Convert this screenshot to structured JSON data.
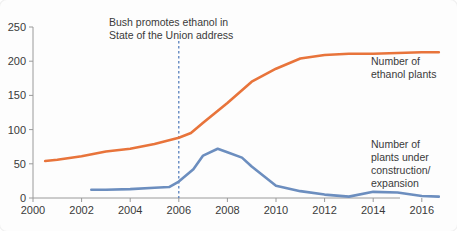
{
  "chart_data": {
    "type": "line",
    "title": "",
    "subtitle": "",
    "xlabel": "",
    "ylabel": "",
    "xlim": [
      2000,
      2017
    ],
    "ylim": [
      0,
      250
    ],
    "grid": false,
    "legend_position": "right-inline",
    "x_ticks": [
      "2000",
      "2002",
      "2004",
      "2006",
      "2008",
      "2010",
      "2012",
      "2014",
      "2016"
    ],
    "x_tick_values": [
      2000,
      2002,
      2004,
      2006,
      2008,
      2010,
      2012,
      2014,
      2016
    ],
    "y_ticks": [
      "0",
      "50",
      "100",
      "150",
      "200",
      "250"
    ],
    "y_tick_values": [
      0,
      50,
      100,
      150,
      200,
      250
    ],
    "series": [
      {
        "name": "Number of ethanol plants",
        "color": "#E8743B",
        "x": [
          2000.5,
          2001,
          2002,
          2003,
          2004,
          2005,
          2006,
          2006.5,
          2007,
          2008,
          2009,
          2010,
          2011,
          2012,
          2013,
          2014,
          2015,
          2016,
          2016.7
        ],
        "values": [
          54,
          56,
          61,
          68,
          72,
          79,
          88,
          95,
          110,
          139,
          170,
          189,
          204,
          209,
          211,
          211,
          212,
          213,
          213
        ]
      },
      {
        "name": "Number of plants under construction/expansion",
        "color": "#6C8EBF",
        "x": [
          2002.4,
          2003,
          2004,
          2005,
          2005.6,
          2006,
          2006.6,
          2007,
          2007.6,
          2008,
          2008.6,
          2009,
          2010,
          2011,
          2012,
          2013,
          2014,
          2015,
          2016,
          2016.7
        ],
        "values": [
          12,
          12,
          13,
          15,
          16,
          24,
          42,
          62,
          72,
          67,
          59,
          46,
          18,
          10,
          5,
          2,
          9,
          8,
          3,
          2
        ]
      }
    ],
    "annotations": [
      {
        "name": "bush-ethanol-annotation",
        "lines": [
          "Bush promotes ethanol in",
          "State of the Union address"
        ],
        "x": 2006,
        "line_color": "#4A76B8",
        "line_style": "dashed"
      }
    ],
    "legend_labels": [
      {
        "name": "ethanol-plants-legend",
        "lines": [
          "Number of",
          "ethanol plants"
        ],
        "color": "#E8743B"
      },
      {
        "name": "construction-legend",
        "lines": [
          "Number of",
          "plants under",
          "construction/",
          "expansion"
        ],
        "color": "#6C8EBF"
      }
    ]
  },
  "colors": {
    "background": "#fdfdfd",
    "axis": "#9a9a9a",
    "text": "#3a3a3a",
    "orange": "#E8743B",
    "blue": "#6C8EBF",
    "event_line": "#4A76B8"
  }
}
